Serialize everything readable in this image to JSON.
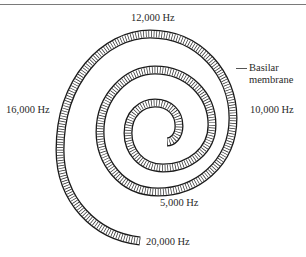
{
  "figure": {
    "structure_label_line1": "Basilar",
    "structure_label_line2": "membrane",
    "frequency_labels": [
      {
        "id": "f12000",
        "text": "12,000 Hz"
      },
      {
        "id": "f16000",
        "text": "16,000 Hz"
      },
      {
        "id": "f10000",
        "text": "10,000 Hz"
      },
      {
        "id": "f5000",
        "text": "5,000 Hz"
      },
      {
        "id": "f20000",
        "text": "20,000 Hz"
      }
    ],
    "colors": {
      "stroke": "#1a1a1a",
      "background": "#ffffff",
      "rule": "#7a7a7a"
    }
  }
}
